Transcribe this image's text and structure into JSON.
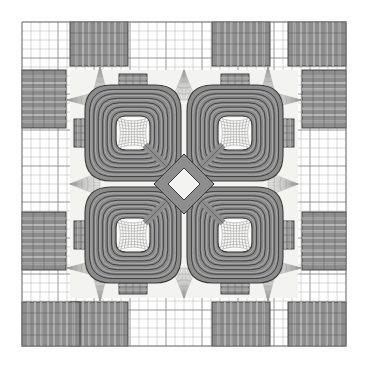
{
  "figure": {
    "title": "",
    "kind": "finite-element-mesh",
    "width": 368,
    "height": 368,
    "background_color": "#ffffff"
  },
  "colors": {
    "background": "#ffffff",
    "grid_line": "#8a8a8a",
    "grid_line_fine": "#b9b9b9",
    "band_fill": "#8d8d8d",
    "band_fill_light": "#a2a2a2",
    "band_stroke": "#3a3a3a",
    "mesh_line": "#707070",
    "mesh_line_fine": "#9a9a9a",
    "interior_fill": "#f3f3f1",
    "coil_fill": "#8b8b8b",
    "coil_stroke": "#383838",
    "diamond_fill": "#8d8d8d"
  },
  "domain": {
    "grid_left": 22,
    "grid_top": 22,
    "grid_right": 346,
    "grid_bottom": 346,
    "grid_cell": 9,
    "grid_columns": 36,
    "grid_rows": 36,
    "inner_region_left": 70,
    "inner_region_top": 70,
    "inner_region_right": 298,
    "inner_region_bottom": 298
  },
  "coils": {
    "count": 4,
    "ring_count": 7,
    "corner_radius": 26,
    "outer_half_size": 48,
    "inner_half_size": 17,
    "centers": [
      {
        "name": "coil-top-left",
        "cx": 133,
        "cy": 133
      },
      {
        "name": "coil-top-right",
        "cx": 235,
        "cy": 133
      },
      {
        "name": "coil-bottom-left",
        "cx": 133,
        "cy": 235
      },
      {
        "name": "coil-bottom-right",
        "cx": 235,
        "cy": 235
      }
    ]
  },
  "center_feature": {
    "name": "center-diamond",
    "cx": 184,
    "cy": 184,
    "outer_radius": 30,
    "inner_radius": 16,
    "band_width": 7
  },
  "stubs": {
    "note": "short striped connector blocks joining coils to outer bands",
    "items": [
      {
        "name": "stub-top-left",
        "x": 119,
        "y": 74,
        "w": 28,
        "h": 22,
        "orient": "horizontal-stripes"
      },
      {
        "name": "stub-top-right",
        "x": 221,
        "y": 74,
        "w": 28,
        "h": 22,
        "orient": "horizontal-stripes"
      },
      {
        "name": "stub-bottom-left",
        "x": 119,
        "y": 272,
        "w": 28,
        "h": 22,
        "orient": "horizontal-stripes"
      },
      {
        "name": "stub-bottom-right",
        "x": 221,
        "y": 272,
        "w": 28,
        "h": 22,
        "orient": "horizontal-stripes"
      },
      {
        "name": "stub-left-top",
        "x": 74,
        "y": 119,
        "w": 22,
        "h": 28,
        "orient": "vertical-stripes"
      },
      {
        "name": "stub-left-bottom",
        "x": 74,
        "y": 221,
        "w": 22,
        "h": 28,
        "orient": "vertical-stripes"
      },
      {
        "name": "stub-right-top",
        "x": 272,
        "y": 119,
        "w": 22,
        "h": 28,
        "orient": "vertical-stripes"
      },
      {
        "name": "stub-right-bottom",
        "x": 272,
        "y": 221,
        "w": 22,
        "h": 28,
        "orient": "vertical-stripes"
      }
    ]
  },
  "outer_bands": {
    "note": "dense striped rectangular bands on the four outer sides",
    "items": [
      {
        "name": "band-top-inner-left",
        "x": 70,
        "y": 22,
        "w": 58,
        "h": 44,
        "stripes": "vertical",
        "count": 9
      },
      {
        "name": "band-top-inner-right",
        "x": 212,
        "y": 22,
        "w": 58,
        "h": 44,
        "stripes": "vertical",
        "count": 9
      },
      {
        "name": "band-bottom-inner-left",
        "x": 70,
        "y": 302,
        "w": 58,
        "h": 44,
        "stripes": "vertical",
        "count": 9
      },
      {
        "name": "band-bottom-inner-right",
        "x": 212,
        "y": 302,
        "w": 58,
        "h": 44,
        "stripes": "vertical",
        "count": 9
      },
      {
        "name": "band-left-inner-top",
        "x": 22,
        "y": 70,
        "w": 44,
        "h": 58,
        "stripes": "horizontal",
        "count": 9
      },
      {
        "name": "band-left-inner-bottom",
        "x": 22,
        "y": 212,
        "w": 44,
        "h": 58,
        "stripes": "horizontal",
        "count": 9
      },
      {
        "name": "band-right-inner-top",
        "x": 302,
        "y": 70,
        "w": 44,
        "h": 58,
        "stripes": "horizontal",
        "count": 9
      },
      {
        "name": "band-right-inner-bottom",
        "x": 302,
        "y": 212,
        "w": 44,
        "h": 58,
        "stripes": "horizontal",
        "count": 9
      },
      {
        "name": "band-corner-top-left",
        "x": 22,
        "y": 22,
        "w": 0,
        "h": 0,
        "stripes": "none",
        "count": 0
      }
    ]
  },
  "legend": {
    "visible": false,
    "entries": []
  },
  "axes": {
    "visible": false,
    "x_ticks": [],
    "y_ticks": [],
    "xlabel": "",
    "ylabel": ""
  }
}
